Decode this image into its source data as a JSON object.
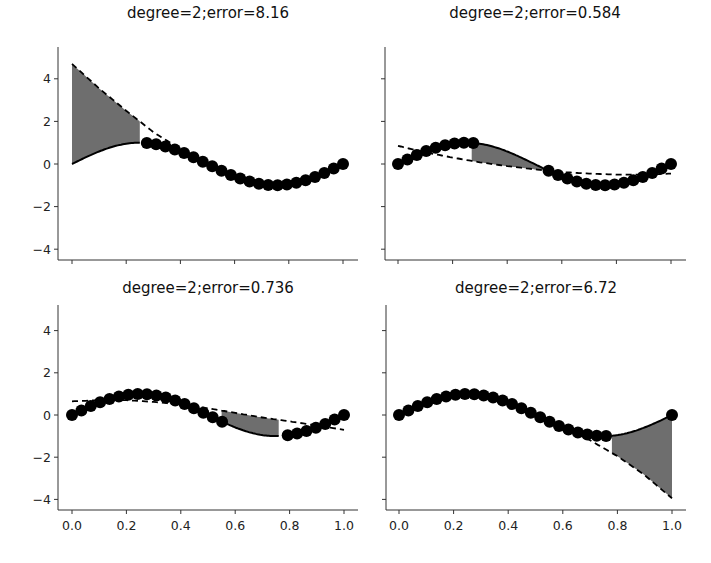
{
  "chart_data": [
    {
      "type": "line",
      "title": "degree=2;error=8.16",
      "xlabel": "",
      "ylabel": "",
      "xlim": [
        0.0,
        1.0
      ],
      "ylim": [
        -4.5,
        5.0
      ],
      "xticks": [
        "0.0",
        "0.2",
        "0.4",
        "0.6",
        "0.8",
        "1.0"
      ],
      "yticks": [
        "-4",
        "-2",
        "0",
        "2",
        "4"
      ],
      "show_xtick_labels": false,
      "show_ytick_labels": true,
      "grid": false,
      "gap": [
        0.0,
        0.25
      ],
      "true_curve": "sin(2*pi*x)",
      "fit_line": {
        "x": [
          0.0,
          0.1,
          0.2,
          0.25,
          0.3,
          0.4,
          0.5,
          0.6,
          0.7,
          0.8,
          0.9,
          1.0
        ],
        "y": [
          4.7,
          3.55,
          2.5,
          2.0,
          1.5,
          0.7,
          0.05,
          -0.5,
          -0.85,
          -0.95,
          -0.6,
          0.05
        ]
      },
      "points_description": "samples of sin(2*pi*x) on x in [0.27,1.0]",
      "shaded_region": {
        "x_range": [
          0.0,
          0.25
        ],
        "between": "true_curve and fit_line"
      }
    },
    {
      "type": "line",
      "title": "degree=2;error=0.584",
      "xlabel": "",
      "ylabel": "",
      "xlim": [
        0.0,
        1.0
      ],
      "ylim": [
        -4.5,
        5.0
      ],
      "xticks": [
        "0.0",
        "0.2",
        "0.4",
        "0.6",
        "0.8",
        "1.0"
      ],
      "yticks": [
        "-4",
        "-2",
        "0",
        "2",
        "4"
      ],
      "show_xtick_labels": false,
      "show_ytick_labels": false,
      "grid": false,
      "gap": [
        0.27,
        0.55
      ],
      "true_curve": "sin(2*pi*x)",
      "fit_line": {
        "x": [
          0.0,
          0.1,
          0.2,
          0.3,
          0.4,
          0.5,
          0.6,
          0.7,
          0.8,
          0.9,
          1.0
        ],
        "y": [
          0.85,
          0.55,
          0.3,
          0.08,
          -0.1,
          -0.25,
          -0.38,
          -0.45,
          -0.5,
          -0.5,
          -0.45
        ]
      },
      "points_description": "samples of sin(2*pi*x) on x in [0,0.27] and [0.55,1.0]",
      "shaded_region": {
        "x_range": [
          0.27,
          0.55
        ],
        "between": "true_curve and fit_line"
      }
    },
    {
      "type": "line",
      "title": "degree=2;error=0.736",
      "xlabel": "",
      "ylabel": "",
      "xlim": [
        0.0,
        1.0
      ],
      "ylim": [
        -4.5,
        5.0
      ],
      "xticks": [
        "0.0",
        "0.2",
        "0.4",
        "0.6",
        "0.8",
        "1.0"
      ],
      "yticks": [
        "-4",
        "-2",
        "0",
        "2",
        "4"
      ],
      "show_xtick_labels": true,
      "show_ytick_labels": true,
      "grid": false,
      "gap": [
        0.55,
        0.77
      ],
      "true_curve": "sin(2*pi*x)",
      "fit_line": {
        "x": [
          0.0,
          0.1,
          0.2,
          0.3,
          0.4,
          0.5,
          0.6,
          0.7,
          0.8,
          0.9,
          1.0
        ],
        "y": [
          0.65,
          0.7,
          0.7,
          0.62,
          0.5,
          0.32,
          0.1,
          -0.12,
          -0.3,
          -0.5,
          -0.7
        ]
      },
      "points_description": "samples of sin(2*pi*x) on x in [0,0.52] and [0.79,1.0]",
      "shaded_region": {
        "x_range": [
          0.55,
          0.76
        ],
        "between": "true_curve and fit_line"
      }
    },
    {
      "type": "line",
      "title": "degree=2;error=6.72",
      "xlabel": "",
      "ylabel": "",
      "xlim": [
        0.0,
        1.0
      ],
      "ylim": [
        -4.5,
        5.0
      ],
      "xticks": [
        "0.0",
        "0.2",
        "0.4",
        "0.6",
        "0.8",
        "1.0"
      ],
      "yticks": [
        "-4",
        "-2",
        "0",
        "2",
        "4"
      ],
      "show_xtick_labels": true,
      "show_ytick_labels": false,
      "grid": false,
      "gap": [
        0.78,
        1.0
      ],
      "true_curve": "sin(2*pi*x)",
      "fit_line": {
        "x": [
          0.0,
          0.1,
          0.2,
          0.3,
          0.4,
          0.5,
          0.6,
          0.7,
          0.8,
          0.9,
          1.0
        ],
        "y": [
          0.05,
          0.7,
          1.0,
          0.95,
          0.6,
          0.05,
          -0.55,
          -1.2,
          -1.95,
          -2.85,
          -3.95
        ]
      },
      "points_description": "samples of sin(2*pi*x) on x in [0,0.77]",
      "shaded_region": {
        "x_range": [
          0.78,
          1.0
        ],
        "between": "true_curve and fit_line"
      }
    }
  ],
  "style": {
    "point_color": "#000000",
    "curve_color": "#000000",
    "fit_color": "#000000",
    "shade_color": "#6e6e6e",
    "axis_color": "#333333"
  }
}
